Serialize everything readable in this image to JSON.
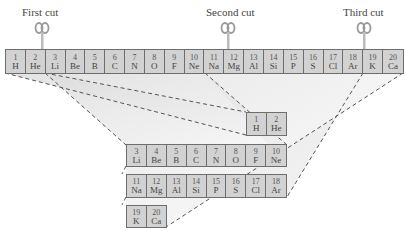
{
  "cuts": [
    {
      "label": "First cut",
      "x": 40
    },
    {
      "label": "Second cut",
      "x": 227
    },
    {
      "label": "Third cut",
      "x": 364
    }
  ],
  "strip": {
    "elements": [
      {
        "num": "1",
        "sym": "H"
      },
      {
        "num": "2",
        "sym": "He"
      },
      {
        "num": "3",
        "sym": "Li"
      },
      {
        "num": "4",
        "sym": "Be"
      },
      {
        "num": "5",
        "sym": "B"
      },
      {
        "num": "6",
        "sym": "C"
      },
      {
        "num": "7",
        "sym": "N"
      },
      {
        "num": "8",
        "sym": "O"
      },
      {
        "num": "9",
        "sym": "F"
      },
      {
        "num": "10",
        "sym": "Ne"
      },
      {
        "num": "11",
        "sym": "Na"
      },
      {
        "num": "12",
        "sym": "Mg"
      },
      {
        "num": "13",
        "sym": "Al"
      },
      {
        "num": "14",
        "sym": "Si"
      },
      {
        "num": "15",
        "sym": "P"
      },
      {
        "num": "16",
        "sym": "S"
      },
      {
        "num": "17",
        "sym": "Cl"
      },
      {
        "num": "18",
        "sym": "Ar"
      },
      {
        "num": "19",
        "sym": "K"
      },
      {
        "num": "20",
        "sym": "Ca"
      }
    ]
  },
  "rows": [
    {
      "elements": [
        {
          "num": "1",
          "sym": "H"
        },
        {
          "num": "2",
          "sym": "He"
        }
      ]
    },
    {
      "elements": [
        {
          "num": "3",
          "sym": "Li"
        },
        {
          "num": "4",
          "sym": "Be"
        },
        {
          "num": "5",
          "sym": "B"
        },
        {
          "num": "6",
          "sym": "C"
        },
        {
          "num": "7",
          "sym": "N"
        },
        {
          "num": "8",
          "sym": "O"
        },
        {
          "num": "9",
          "sym": "F"
        },
        {
          "num": "10",
          "sym": "Ne"
        }
      ]
    },
    {
      "elements": [
        {
          "num": "11",
          "sym": "Na"
        },
        {
          "num": "12",
          "sym": "Mg"
        },
        {
          "num": "13",
          "sym": "Al"
        },
        {
          "num": "14",
          "sym": "Si"
        },
        {
          "num": "15",
          "sym": "P"
        },
        {
          "num": "16",
          "sym": "S"
        },
        {
          "num": "17",
          "sym": "Cl"
        },
        {
          "num": "18",
          "sym": "Ar"
        }
      ]
    },
    {
      "elements": [
        {
          "num": "19",
          "sym": "K"
        },
        {
          "num": "20",
          "sym": "Ca"
        }
      ]
    }
  ],
  "colors": {
    "cell_fill": "#d2d2d2",
    "border": "#6e6e6e",
    "shade": "#e6e6e6",
    "dash": "#555555"
  }
}
